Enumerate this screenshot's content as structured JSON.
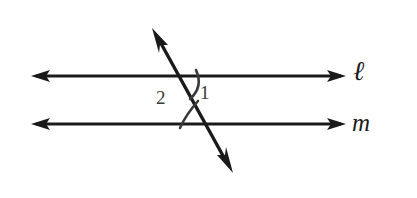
{
  "figure": {
    "background_color": "#ffffff",
    "stroke_color": "#1a1a1a",
    "arc_color": "#3a3a3a",
    "width": 417,
    "height": 198
  },
  "lines": [
    {
      "id": "line-l",
      "label": "ℓ",
      "orientation": "horizontal",
      "y": 76,
      "x_start": 32,
      "x_end": 345,
      "arrowheads": "both",
      "label_x": 353,
      "label_y": 58
    },
    {
      "id": "line-m",
      "label": "m",
      "orientation": "horizontal",
      "y": 124,
      "x_start": 32,
      "x_end": 345,
      "arrowheads": "both",
      "label_x": 352,
      "label_y": 110
    },
    {
      "id": "transversal",
      "label": "",
      "orientation": "diagonal",
      "x_start": 152,
      "y_start": 28,
      "x_end": 232,
      "y_end": 172,
      "arrowheads": "both"
    }
  ],
  "intersections": [
    {
      "id": "intersection-upper",
      "line": "ℓ",
      "x": 185,
      "y": 76
    },
    {
      "id": "intersection-lower",
      "line": "m",
      "x": 211,
      "y": 124
    }
  ],
  "angles": [
    {
      "id": "angle-1",
      "label": "1",
      "at_intersection": "intersection-upper",
      "position": "below-line-l-right-of-transversal",
      "label_x": 200,
      "label_y": 83
    },
    {
      "id": "angle-2",
      "label": "2",
      "at_intersection": "intersection-lower",
      "position": "above-line-m-left-of-transversal",
      "label_x": 156,
      "label_y": 88
    }
  ]
}
